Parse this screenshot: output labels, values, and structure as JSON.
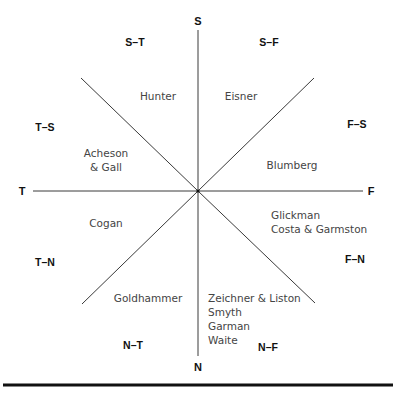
{
  "poles": {
    "S": "S",
    "N": "N",
    "T": "T",
    "F": "F"
  },
  "combinations": {
    "s_t": "S–T",
    "s_f": "S–F",
    "t_s": "T–S",
    "f_s": "F–S",
    "t_n": "T–N",
    "f_n": "F–N",
    "n_t": "N–T",
    "n_f": "N–F"
  },
  "authors": {
    "hunter": "Hunter",
    "eisner": "Eisner",
    "acheson_gall": [
      "Acheson",
      "& Gall"
    ],
    "blumberg": "Blumberg",
    "cogan": "Cogan",
    "glickman_group": [
      "Glickman",
      "Costa & Garmston"
    ],
    "goldhammer": "Goldhammer",
    "zeichner_group": [
      "Zeichner & Liston",
      "Smyth",
      "Garman",
      "Waite"
    ]
  },
  "colors": {
    "lines": "#3a3a3a",
    "labels": "#111111",
    "authors": "#444444"
  }
}
